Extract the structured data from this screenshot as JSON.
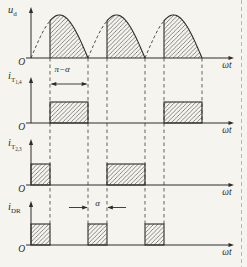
{
  "figure": {
    "background_color": "#f6f4ef",
    "ink_color": "#2e2c29",
    "guide_color": "#4c4844",
    "border_dash_color": "#bdb6a6",
    "alpha_fraction_of_pi": 0.3333,
    "guides_over_pi": [
      0.3333,
      1,
      1.3333,
      2,
      2.3333,
      3
    ]
  },
  "panels": [
    {
      "id": "ud",
      "kind": "rectified-sine",
      "y_label": {
        "base": "u",
        "sub": "d"
      },
      "x_label": "ωt",
      "origin_label": "O",
      "humps_over_pi": [
        [
          0.3333,
          1
        ],
        [
          1.3333,
          2
        ],
        [
          2.3333,
          3
        ]
      ],
      "dashed_rises_over_pi": [
        [
          0,
          0.3333
        ],
        [
          1,
          1.3333
        ],
        [
          2,
          2.3333
        ]
      ]
    },
    {
      "id": "it14",
      "kind": "pulses",
      "y_label": {
        "base": "i",
        "sub": "T",
        "subsub": "1,4"
      },
      "x_label": "ωt",
      "origin_label": "O",
      "pulses_over_pi": [
        [
          0.3333,
          1
        ],
        [
          2.3333,
          3
        ]
      ],
      "annotation": {
        "text": "π−α",
        "from": 0.3333,
        "to": 1,
        "style": "between"
      }
    },
    {
      "id": "it23",
      "kind": "pulses",
      "y_label": {
        "base": "i",
        "sub": "T",
        "subsub": "2,3"
      },
      "x_label": "ωt",
      "origin_label": "O",
      "pulses_over_pi": [
        [
          0,
          0.3333
        ],
        [
          1.3333,
          2
        ]
      ]
    },
    {
      "id": "idr",
      "kind": "pulses",
      "y_label": {
        "base": "i",
        "sub": "DR"
      },
      "x_label": "ωt",
      "origin_label": "O",
      "pulses_over_pi": [
        [
          0,
          0.3333
        ],
        [
          1,
          1.3333
        ],
        [
          2,
          2.3333
        ]
      ],
      "annotation": {
        "text": "α",
        "from": 1,
        "to": 1.3333,
        "style": "outside"
      }
    }
  ]
}
